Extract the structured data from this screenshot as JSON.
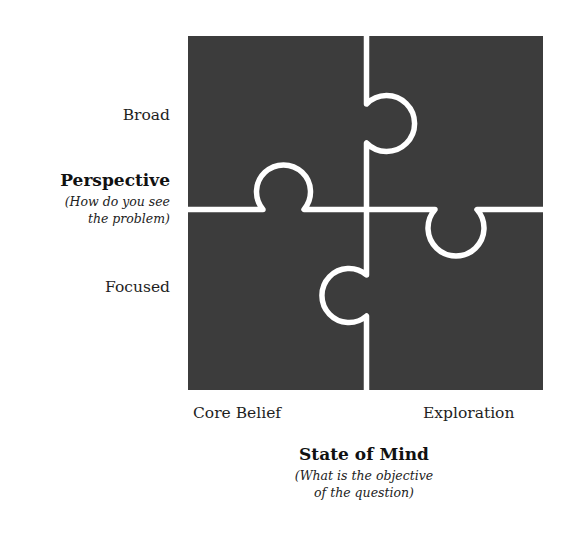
{
  "diagram": {
    "type": "2x2 jigsaw puzzle matrix",
    "colors": {
      "piece_fill": "#3c3c3c",
      "gap": "#ffffff",
      "text": "#1e1e1e"
    },
    "pieces": [
      {
        "position": "top-left",
        "row": "Broad",
        "column": "Core Belief"
      },
      {
        "position": "top-right",
        "row": "Broad",
        "column": "Exploration"
      },
      {
        "position": "bottom-left",
        "row": "Focused",
        "column": "Core Belief"
      },
      {
        "position": "bottom-right",
        "row": "Focused",
        "column": "Exploration"
      }
    ]
  },
  "y_axis": {
    "title": "Perspective",
    "subtitle_line1": "(How do you see",
    "subtitle_line2": "the problem)",
    "top_label": "Broad",
    "bottom_label": "Focused"
  },
  "x_axis": {
    "title": "State of Mind",
    "subtitle_line1": "(What is the objective",
    "subtitle_line2": "of the question)",
    "left_label": "Core Belief",
    "right_label": "Exploration"
  }
}
